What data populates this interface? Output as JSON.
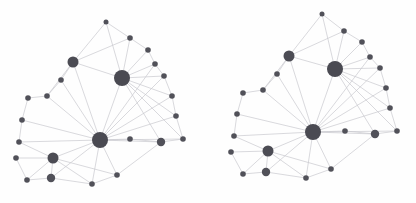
{
  "figure": {
    "title": "",
    "background_color": "#fefefe",
    "width": 416,
    "height": 203,
    "watermark_left": "",
    "watermark_right": ""
  },
  "style": {
    "node_color": "#4a4a52",
    "edge_color": "#c9c9cf",
    "edge_width": 0.7,
    "hub_radius": 8,
    "medium_radius": 5.5,
    "small_radius": 2.5
  },
  "chart_data": {
    "type": "scatter",
    "title": "",
    "subtitle": "",
    "xlabel": "",
    "ylabel": "",
    "grid": false,
    "legend": "none",
    "panels": [
      {
        "name": "left-network",
        "nodes": [
          {
            "id": "L0",
            "x": 100,
            "y": 140,
            "size": "hub",
            "r": 8,
            "degree": 17
          },
          {
            "id": "L1",
            "x": 122,
            "y": 78,
            "size": "hub",
            "r": 8,
            "degree": 14
          },
          {
            "id": "L2",
            "x": 73,
            "y": 62,
            "size": "medium",
            "r": 5.5,
            "degree": 9
          },
          {
            "id": "L3",
            "x": 53,
            "y": 158,
            "size": "medium",
            "r": 5.5,
            "degree": 7
          },
          {
            "id": "L4",
            "x": 106,
            "y": 22,
            "size": "small",
            "r": 2.5,
            "degree": 2
          },
          {
            "id": "L5",
            "x": 130,
            "y": 38,
            "size": "small",
            "r": 2.8,
            "degree": 3
          },
          {
            "id": "L6",
            "x": 148,
            "y": 50,
            "size": "small",
            "r": 2.8,
            "degree": 3
          },
          {
            "id": "L7",
            "x": 155,
            "y": 64,
            "size": "small",
            "r": 2.8,
            "degree": 3
          },
          {
            "id": "L8",
            "x": 164,
            "y": 76,
            "size": "small",
            "r": 2.8,
            "degree": 3
          },
          {
            "id": "L9",
            "x": 172,
            "y": 96,
            "size": "small",
            "r": 2.8,
            "degree": 3
          },
          {
            "id": "L10",
            "x": 176,
            "y": 116,
            "size": "small",
            "r": 2.8,
            "degree": 3
          },
          {
            "id": "L11",
            "x": 183,
            "y": 139,
            "size": "small",
            "r": 2.8,
            "degree": 3
          },
          {
            "id": "L12",
            "x": 161,
            "y": 142,
            "size": "small",
            "r": 4.2,
            "degree": 5
          },
          {
            "id": "L13",
            "x": 130,
            "y": 139,
            "size": "small",
            "r": 2.8,
            "degree": 3
          },
          {
            "id": "L14",
            "x": 61,
            "y": 80,
            "size": "small",
            "r": 2.8,
            "degree": 2
          },
          {
            "id": "L15",
            "x": 47,
            "y": 96,
            "size": "small",
            "r": 2.8,
            "degree": 3
          },
          {
            "id": "L16",
            "x": 28,
            "y": 98,
            "size": "small",
            "r": 2.8,
            "degree": 2
          },
          {
            "id": "L17",
            "x": 22,
            "y": 120,
            "size": "small",
            "r": 2.8,
            "degree": 3
          },
          {
            "id": "L18",
            "x": 19,
            "y": 142,
            "size": "small",
            "r": 2.8,
            "degree": 3
          },
          {
            "id": "L19",
            "x": 16,
            "y": 158,
            "size": "small",
            "r": 2.8,
            "degree": 2
          },
          {
            "id": "L20",
            "x": 27,
            "y": 180,
            "size": "small",
            "r": 2.8,
            "degree": 2
          },
          {
            "id": "L21",
            "x": 51,
            "y": 178,
            "size": "small",
            "r": 4.2,
            "degree": 4
          },
          {
            "id": "L22",
            "x": 92,
            "y": 184,
            "size": "small",
            "r": 2.8,
            "degree": 2
          },
          {
            "id": "L23",
            "x": 117,
            "y": 175,
            "size": "small",
            "r": 2.8,
            "degree": 3
          }
        ],
        "edges": [
          [
            "L0",
            "L1"
          ],
          [
            "L0",
            "L2"
          ],
          [
            "L0",
            "L3"
          ],
          [
            "L0",
            "L13"
          ],
          [
            "L0",
            "L12"
          ],
          [
            "L0",
            "L21"
          ],
          [
            "L0",
            "L23"
          ],
          [
            "L0",
            "L18"
          ],
          [
            "L0",
            "L17"
          ],
          [
            "L0",
            "L15"
          ],
          [
            "L0",
            "L14"
          ],
          [
            "L0",
            "L22"
          ],
          [
            "L0",
            "L11"
          ],
          [
            "L0",
            "L10"
          ],
          [
            "L0",
            "L9"
          ],
          [
            "L0",
            "L8"
          ],
          [
            "L0",
            "L7"
          ],
          [
            "L1",
            "L4"
          ],
          [
            "L1",
            "L5"
          ],
          [
            "L1",
            "L6"
          ],
          [
            "L1",
            "L7"
          ],
          [
            "L1",
            "L8"
          ],
          [
            "L1",
            "L9"
          ],
          [
            "L1",
            "L10"
          ],
          [
            "L1",
            "L11"
          ],
          [
            "L1",
            "L12"
          ],
          [
            "L1",
            "L2"
          ],
          [
            "L2",
            "L5"
          ],
          [
            "L2",
            "L14"
          ],
          [
            "L2",
            "L15"
          ],
          [
            "L2",
            "L4"
          ],
          [
            "L3",
            "L18"
          ],
          [
            "L3",
            "L19"
          ],
          [
            "L3",
            "L20"
          ],
          [
            "L3",
            "L21"
          ],
          [
            "L3",
            "L22"
          ],
          [
            "L3",
            "L23"
          ],
          [
            "L4",
            "L5"
          ],
          [
            "L5",
            "L6"
          ],
          [
            "L6",
            "L7"
          ],
          [
            "L7",
            "L8"
          ],
          [
            "L8",
            "L9"
          ],
          [
            "L9",
            "L10"
          ],
          [
            "L10",
            "L11"
          ],
          [
            "L11",
            "L12"
          ],
          [
            "L12",
            "L13"
          ],
          [
            "L14",
            "L15"
          ],
          [
            "L15",
            "L16"
          ],
          [
            "L16",
            "L17"
          ],
          [
            "L17",
            "L18"
          ],
          [
            "L19",
            "L20"
          ],
          [
            "L20",
            "L21"
          ],
          [
            "L21",
            "L22"
          ],
          [
            "L22",
            "L23"
          ],
          [
            "L23",
            "L12"
          ]
        ]
      },
      {
        "name": "right-network",
        "nodes": [
          {
            "id": "R0",
            "x": 313,
            "y": 132,
            "size": "hub",
            "r": 8,
            "degree": 17
          },
          {
            "id": "R1",
            "x": 335,
            "y": 69,
            "size": "hub",
            "r": 8,
            "degree": 14
          },
          {
            "id": "R2",
            "x": 289,
            "y": 56,
            "size": "medium",
            "r": 5.5,
            "degree": 9
          },
          {
            "id": "R3",
            "x": 268,
            "y": 151,
            "size": "medium",
            "r": 5.5,
            "degree": 7
          },
          {
            "id": "R4",
            "x": 322,
            "y": 14,
            "size": "small",
            "r": 2.5,
            "degree": 2
          },
          {
            "id": "R5",
            "x": 344,
            "y": 31,
            "size": "small",
            "r": 2.8,
            "degree": 3
          },
          {
            "id": "R6",
            "x": 362,
            "y": 42,
            "size": "small",
            "r": 2.8,
            "degree": 3
          },
          {
            "id": "R7",
            "x": 370,
            "y": 57,
            "size": "small",
            "r": 2.8,
            "degree": 3
          },
          {
            "id": "R8",
            "x": 380,
            "y": 68,
            "size": "small",
            "r": 2.8,
            "degree": 3
          },
          {
            "id": "R9",
            "x": 386,
            "y": 88,
            "size": "small",
            "r": 2.8,
            "degree": 3
          },
          {
            "id": "R10",
            "x": 390,
            "y": 108,
            "size": "small",
            "r": 2.8,
            "degree": 3
          },
          {
            "id": "R11",
            "x": 397,
            "y": 131,
            "size": "small",
            "r": 2.8,
            "degree": 3
          },
          {
            "id": "R12",
            "x": 375,
            "y": 134,
            "size": "small",
            "r": 4.2,
            "degree": 5
          },
          {
            "id": "R13",
            "x": 345,
            "y": 131,
            "size": "small",
            "r": 2.8,
            "degree": 3
          },
          {
            "id": "R14",
            "x": 277,
            "y": 74,
            "size": "small",
            "r": 2.8,
            "degree": 2
          },
          {
            "id": "R15",
            "x": 263,
            "y": 90,
            "size": "small",
            "r": 2.8,
            "degree": 3
          },
          {
            "id": "R16",
            "x": 243,
            "y": 93,
            "size": "small",
            "r": 2.8,
            "degree": 2
          },
          {
            "id": "R17",
            "x": 237,
            "y": 114,
            "size": "small",
            "r": 2.8,
            "degree": 3
          },
          {
            "id": "R18",
            "x": 234,
            "y": 136,
            "size": "small",
            "r": 2.8,
            "degree": 3
          },
          {
            "id": "R19",
            "x": 231,
            "y": 152,
            "size": "small",
            "r": 2.8,
            "degree": 2
          },
          {
            "id": "R20",
            "x": 243,
            "y": 174,
            "size": "small",
            "r": 2.8,
            "degree": 2
          },
          {
            "id": "R21",
            "x": 266,
            "y": 172,
            "size": "small",
            "r": 4.2,
            "degree": 4
          },
          {
            "id": "R22",
            "x": 306,
            "y": 178,
            "size": "small",
            "r": 2.8,
            "degree": 2
          },
          {
            "id": "R23",
            "x": 331,
            "y": 169,
            "size": "small",
            "r": 2.8,
            "degree": 3
          }
        ],
        "edges": [
          [
            "R0",
            "R1"
          ],
          [
            "R0",
            "R2"
          ],
          [
            "R0",
            "R3"
          ],
          [
            "R0",
            "R13"
          ],
          [
            "R0",
            "R12"
          ],
          [
            "R0",
            "R21"
          ],
          [
            "R0",
            "R23"
          ],
          [
            "R0",
            "R18"
          ],
          [
            "R0",
            "R17"
          ],
          [
            "R0",
            "R15"
          ],
          [
            "R0",
            "R14"
          ],
          [
            "R0",
            "R22"
          ],
          [
            "R0",
            "R11"
          ],
          [
            "R0",
            "R10"
          ],
          [
            "R0",
            "R9"
          ],
          [
            "R0",
            "R8"
          ],
          [
            "R0",
            "R7"
          ],
          [
            "R1",
            "R4"
          ],
          [
            "R1",
            "R5"
          ],
          [
            "R1",
            "R6"
          ],
          [
            "R1",
            "R7"
          ],
          [
            "R1",
            "R8"
          ],
          [
            "R1",
            "R9"
          ],
          [
            "R1",
            "R10"
          ],
          [
            "R1",
            "R11"
          ],
          [
            "R1",
            "R12"
          ],
          [
            "R1",
            "R2"
          ],
          [
            "R2",
            "R5"
          ],
          [
            "R2",
            "R14"
          ],
          [
            "R2",
            "R15"
          ],
          [
            "R2",
            "R4"
          ],
          [
            "R3",
            "R18"
          ],
          [
            "R3",
            "R19"
          ],
          [
            "R3",
            "R20"
          ],
          [
            "R3",
            "R21"
          ],
          [
            "R3",
            "R22"
          ],
          [
            "R3",
            "R23"
          ],
          [
            "R4",
            "R5"
          ],
          [
            "R5",
            "R6"
          ],
          [
            "R6",
            "R7"
          ],
          [
            "R7",
            "R8"
          ],
          [
            "R8",
            "R9"
          ],
          [
            "R9",
            "R10"
          ],
          [
            "R10",
            "R11"
          ],
          [
            "R11",
            "R12"
          ],
          [
            "R12",
            "R13"
          ],
          [
            "R14",
            "R15"
          ],
          [
            "R15",
            "R16"
          ],
          [
            "R16",
            "R17"
          ],
          [
            "R17",
            "R18"
          ],
          [
            "R19",
            "R20"
          ],
          [
            "R20",
            "R21"
          ],
          [
            "R21",
            "R22"
          ],
          [
            "R22",
            "R23"
          ],
          [
            "R23",
            "R12"
          ]
        ]
      }
    ]
  }
}
